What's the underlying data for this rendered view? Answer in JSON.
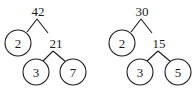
{
  "diagram": {
    "type": "factor-tree",
    "colors": {
      "stroke": "#1a1a1a",
      "text": "#1a1a1a",
      "background": "#ffffff"
    },
    "trees": [
      {
        "root": {
          "label": "42",
          "x": 38,
          "y": 11
        },
        "left_leaf": {
          "label": "2",
          "cx": 18,
          "cy": 43,
          "r": 13
        },
        "middle": {
          "label": "21",
          "x": 56,
          "y": 43
        },
        "bottom_left_leaf": {
          "label": "3",
          "cx": 36,
          "cy": 72,
          "r": 13
        },
        "bottom_right_leaf": {
          "label": "7",
          "cx": 73,
          "cy": 72,
          "r": 13
        }
      },
      {
        "root": {
          "label": "30",
          "x": 142,
          "y": 11
        },
        "left_leaf": {
          "label": "2",
          "cx": 122,
          "cy": 43,
          "r": 13
        },
        "middle": {
          "label": "15",
          "x": 159,
          "y": 43
        },
        "bottom_left_leaf": {
          "label": "3",
          "cx": 140,
          "cy": 72,
          "r": 13
        },
        "bottom_right_leaf": {
          "label": "5",
          "cx": 178,
          "cy": 72,
          "r": 13
        }
      }
    ]
  }
}
